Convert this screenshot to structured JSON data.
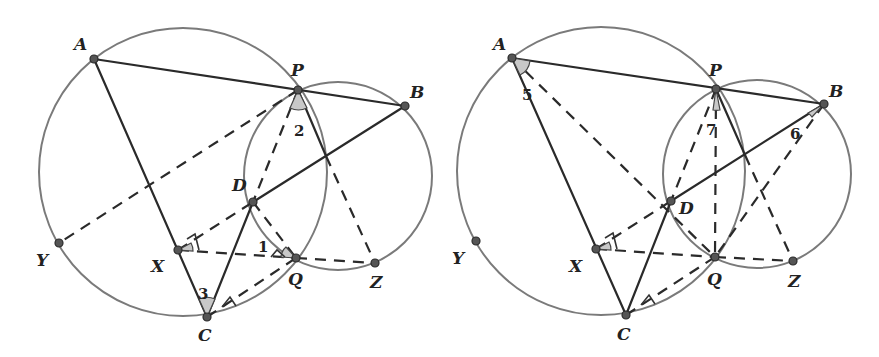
{
  "figures": [
    {
      "id": "left",
      "points": {
        "A": {
          "label": "A",
          "x": 94,
          "y": 59,
          "lx": 74,
          "ly": 50
        },
        "P": {
          "label": "P",
          "x": 298,
          "y": 90,
          "lx": 291,
          "ly": 76
        },
        "B": {
          "label": "B",
          "x": 405,
          "y": 106,
          "lx": 410,
          "ly": 98
        },
        "D": {
          "label": "D",
          "x": 253,
          "y": 202,
          "lx": 232,
          "ly": 191
        },
        "X": {
          "label": "X",
          "x": 178,
          "y": 250,
          "lx": 151,
          "ly": 272
        },
        "Q": {
          "label": "Q",
          "x": 296,
          "y": 258,
          "lx": 288,
          "ly": 285
        },
        "Z": {
          "label": "Z",
          "x": 375,
          "y": 263,
          "lx": 370,
          "ly": 288
        },
        "C": {
          "label": "C",
          "x": 207,
          "y": 317,
          "lx": 198,
          "ly": 341
        },
        "Y": {
          "label": "Y",
          "x": 59,
          "y": 243,
          "lx": 36,
          "ly": 266
        }
      },
      "angle_numbers": [
        {
          "text": "2",
          "x": 294,
          "y": 136
        },
        {
          "text": "1",
          "x": 258,
          "y": 252
        },
        {
          "text": "3",
          "x": 198,
          "y": 299
        }
      ]
    },
    {
      "id": "right",
      "points": {
        "A": {
          "label": "A",
          "x": 512,
          "y": 58,
          "lx": 493,
          "ly": 50
        },
        "P": {
          "label": "P",
          "x": 716,
          "y": 89,
          "lx": 709,
          "ly": 76
        },
        "B": {
          "label": "B",
          "x": 824,
          "y": 104,
          "lx": 829,
          "ly": 97
        },
        "D": {
          "label": "D",
          "x": 671,
          "y": 201,
          "lx": 679,
          "ly": 214
        },
        "X": {
          "label": "X",
          "x": 596,
          "y": 249,
          "lx": 569,
          "ly": 272
        },
        "Q": {
          "label": "Q",
          "x": 715,
          "y": 257,
          "lx": 707,
          "ly": 285
        },
        "Z": {
          "label": "Z",
          "x": 793,
          "y": 261,
          "lx": 788,
          "ly": 287
        },
        "C": {
          "label": "C",
          "x": 626,
          "y": 315,
          "lx": 617,
          "ly": 340
        },
        "Y": {
          "label": "Y",
          "x": 476,
          "y": 241,
          "lx": 452,
          "ly": 264
        }
      },
      "angle_numbers": [
        {
          "text": "5",
          "x": 526,
          "y": 100
        },
        {
          "text": "7",
          "x": 706,
          "y": 135
        },
        {
          "text": "6",
          "x": 792,
          "y": 139
        }
      ]
    }
  ]
}
